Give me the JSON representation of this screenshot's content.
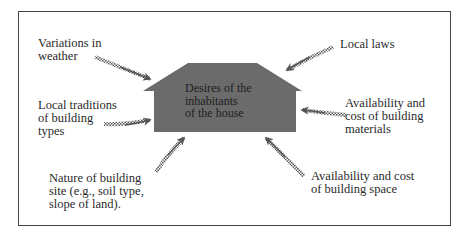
{
  "diagram": {
    "center": {
      "label": "Desires of the\ninhabitants\nof the house",
      "shape": "house",
      "fill": "#6b6b6b"
    },
    "factors": [
      {
        "id": "weather",
        "label": "Variations in\nweather",
        "position": "top-left"
      },
      {
        "id": "laws",
        "label": "Local laws",
        "position": "top-right"
      },
      {
        "id": "traditions",
        "label": "Local traditions\nof building\ntypes",
        "position": "middle-left"
      },
      {
        "id": "materials",
        "label": "Availability and\ncost of building\nmaterials",
        "position": "middle-right"
      },
      {
        "id": "site",
        "label": "Nature of building\nsite (e.g., soil type,\nslope of land).",
        "position": "bottom-left"
      },
      {
        "id": "space",
        "label": "Availability and cost\nof building space",
        "position": "bottom-right"
      }
    ],
    "arrow_style": "checkered-tail",
    "colors": {
      "frame": "#444444",
      "text": "#2a2a2a",
      "arrow": "#555555"
    }
  }
}
